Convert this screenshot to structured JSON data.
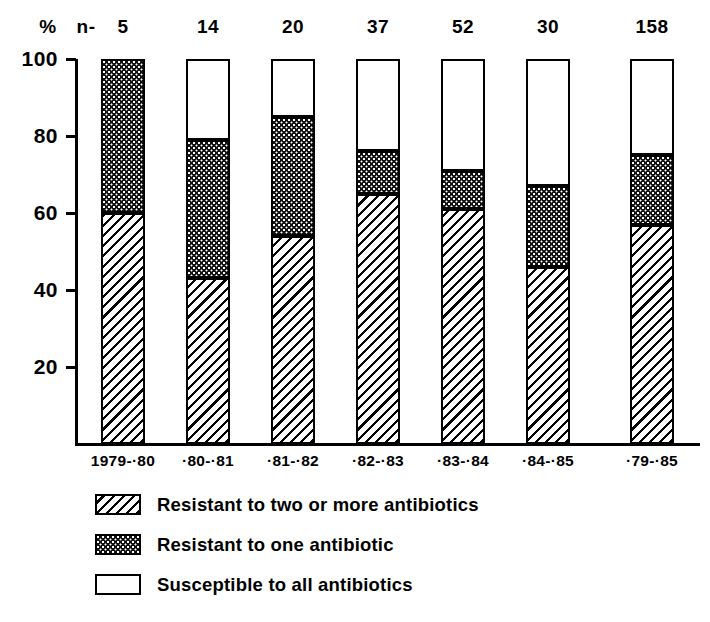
{
  "chart_data": {
    "type": "bar",
    "subtype": "stacked-bar-100pct",
    "title": "",
    "subtitle": "",
    "xlabel": "",
    "ylabel": "%",
    "ylim": [
      0,
      100
    ],
    "yticks": [
      20,
      40,
      60,
      80,
      100
    ],
    "grid": false,
    "legend_position": "bottom-left",
    "sample_size_label": "n-",
    "unit_symbol": "%",
    "categories": [
      "1979-·80",
      "·80-·81",
      "·81-·82",
      "·82-·83",
      "·83-·84",
      "·84-·85",
      "·79-·85"
    ],
    "sample_sizes": [
      5,
      14,
      20,
      37,
      52,
      30,
      158
    ],
    "series": [
      {
        "name": "Resistant to two or more antibiotics",
        "pattern": "diagonal-hatch",
        "values": [
          60,
          43,
          54,
          65,
          61,
          46,
          57
        ]
      },
      {
        "name": "Resistant to one antibiotic",
        "pattern": "dark-stipple",
        "values": [
          40,
          36,
          31,
          11,
          10,
          21,
          18
        ]
      },
      {
        "name": "Susceptible to all antibiotics",
        "pattern": "white",
        "values": [
          0,
          21,
          15,
          24,
          29,
          33,
          25
        ]
      }
    ],
    "cumulative_tops": [
      {
        "hatch_top": 60,
        "dark_top": 100,
        "white_top": 100
      },
      {
        "hatch_top": 43,
        "dark_top": 79,
        "white_top": 100
      },
      {
        "hatch_top": 54,
        "dark_top": 85,
        "white_top": 100
      },
      {
        "hatch_top": 65,
        "dark_top": 76,
        "white_top": 100
      },
      {
        "hatch_top": 61,
        "dark_top": 71,
        "white_top": 100
      },
      {
        "hatch_top": 46,
        "dark_top": 67,
        "white_top": 100
      },
      {
        "hatch_top": 57,
        "dark_top": 75,
        "white_top": 100
      }
    ]
  },
  "axis": {
    "y_unit": "%",
    "ticks": [
      {
        "value": "100"
      },
      {
        "value": "80"
      },
      {
        "value": "60"
      },
      {
        "value": "40"
      },
      {
        "value": "20"
      }
    ]
  },
  "header": {
    "percent_symbol": "%",
    "n_label": "n-",
    "n_values": [
      "5",
      "14",
      "20",
      "37",
      "52",
      "30",
      "158"
    ]
  },
  "xaxis": {
    "labels": [
      "1979-·80",
      "·80-·81",
      "·81-·82",
      "·82-·83",
      "·83-·84",
      "·84-·85",
      "·79-·85"
    ]
  },
  "legend": {
    "items": [
      {
        "label": "Resistant to two or more antibiotics",
        "pattern": "diagonal-hatch"
      },
      {
        "label": "Resistant to one antibiotic",
        "pattern": "dark-stipple"
      },
      {
        "label": "Susceptible to all antibiotics",
        "pattern": "white"
      }
    ]
  },
  "colors": {
    "ink": "#000000",
    "background": "#ffffff",
    "dark_fill": "#111111"
  }
}
